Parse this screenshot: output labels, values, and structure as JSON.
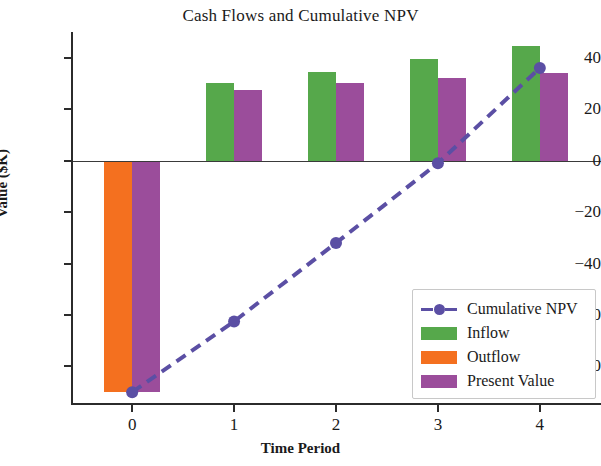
{
  "chart_data": {
    "type": "bar",
    "title": "Cash Flows and Cumulative NPV",
    "xlabel": "Time Period",
    "ylabel": "Value ($K)",
    "categories": [
      "0",
      "1",
      "2",
      "3",
      "4"
    ],
    "x": [
      0,
      1,
      2,
      3,
      4
    ],
    "xlim": [
      -0.6,
      4.6
    ],
    "ylim": [
      -95,
      50
    ],
    "yticks": [
      40,
      20,
      0,
      -20,
      -40,
      -60,
      -80
    ],
    "ytick_labels": [
      "40",
      "20",
      "0",
      "−20",
      "−40",
      "−60",
      "−80"
    ],
    "xticks": [
      0,
      1,
      2,
      3,
      4
    ],
    "xtick_labels": [
      "0",
      "1",
      "2",
      "3",
      "4"
    ],
    "grid": false,
    "legend_position": "lower right",
    "series": [
      {
        "name": "Inflow",
        "type": "bar",
        "color": "#56a84b",
        "values": [
          0,
          30,
          34.5,
          39.5,
          44.5
        ]
      },
      {
        "name": "Outflow",
        "type": "bar",
        "color": "#f4701f",
        "values": [
          -90,
          0,
          0,
          0,
          0
        ]
      },
      {
        "name": "Present Value",
        "type": "bar",
        "color": "#9b4d9b",
        "values": [
          -90,
          27.5,
          30,
          32,
          34
        ]
      },
      {
        "name": "Cumulative NPV",
        "type": "line",
        "color": "#5b4fa4",
        "linestyle": "dashed",
        "marker": "circle",
        "values": [
          -90,
          -62.5,
          -32,
          -1,
          36
        ]
      }
    ]
  },
  "legend": {
    "items": [
      {
        "label": "Cumulative NPV",
        "color": "#5b4fa4",
        "kind": "line"
      },
      {
        "label": "Inflow",
        "color": "#56a84b",
        "kind": "patch"
      },
      {
        "label": "Outflow",
        "color": "#f4701f",
        "kind": "patch"
      },
      {
        "label": "Present Value",
        "color": "#9b4d9b",
        "kind": "patch"
      }
    ]
  }
}
